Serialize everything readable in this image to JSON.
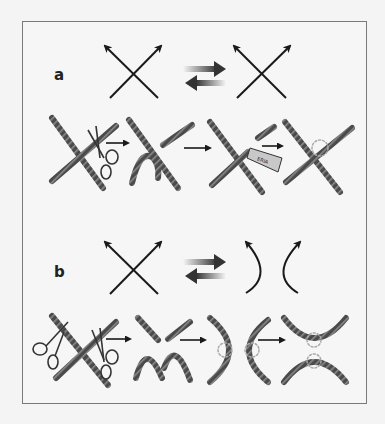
{
  "panels": [
    {
      "label": "a",
      "description": "Crossing change: over-crossing switched to under-crossing",
      "top_row": [
        "crossing-positive",
        "reversible-arrows",
        "crossing-negative"
      ],
      "bottom_row": [
        "crossed-ropes-with-scissors",
        "cut-ropes",
        "glue-tube-rejoin",
        "rejoined-ropes-switched"
      ]
    },
    {
      "label": "b",
      "description": "Smoothing: crossing resolved into two non-crossing arcs",
      "top_row": [
        "crossing-positive",
        "reversible-arrows",
        "smoothed-arcs"
      ],
      "bottom_row": [
        "crossed-ropes-with-two-scissors",
        "cut-rope-pieces",
        "vertical-arcs-glued",
        "horizontal-arcs-glued"
      ]
    }
  ],
  "tube_label": "ERIA",
  "colors": {
    "rope": "#4a4a4a",
    "rope_highlight": "#8a8a8a",
    "line": "#1a1a1a",
    "frame": "#7a7a7a",
    "glue": "#b0b0b0"
  }
}
